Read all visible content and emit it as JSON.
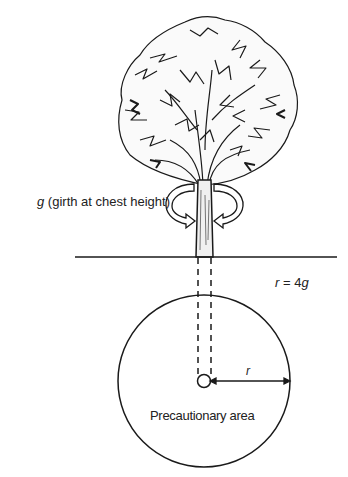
{
  "diagram": {
    "girth_label": {
      "symbol": "g",
      "text": "(girth at chest height)"
    },
    "radius_formula": {
      "symbol": "r",
      "equals": "=",
      "value": "4",
      "unit_symbol": "g"
    },
    "radius_label": "r",
    "area_label": "Precautionary area",
    "colors": {
      "line": "#1a1a1a",
      "background": "#ffffff"
    }
  }
}
